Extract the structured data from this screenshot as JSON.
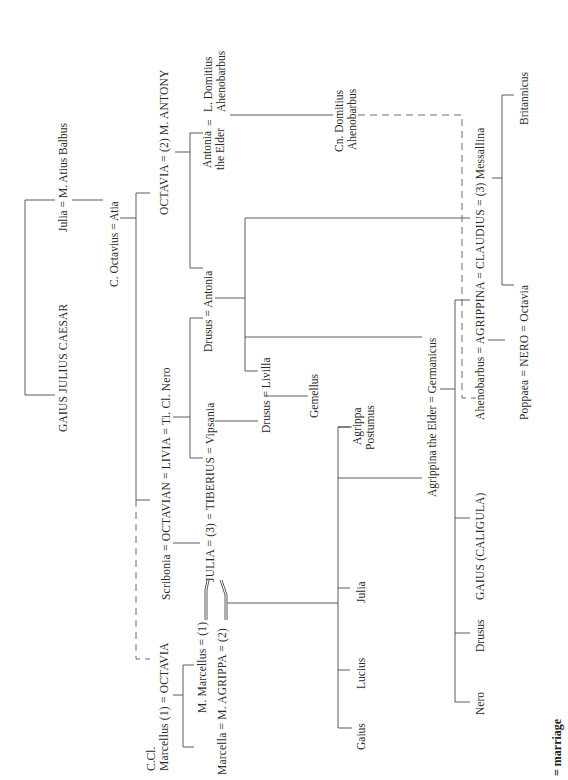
{
  "diagram": {
    "orientation": "rotated 90 degrees counter-clockwise",
    "legend": {
      "symbol": "=",
      "label": "= marriage"
    },
    "people": {
      "caesar": "GAIUS JULIUS CAESAR",
      "julia_balbus": "Julia = M. Atius Balbus",
      "octavius_atia": "C. Octavius = Atia",
      "octavia_antony": "OCTAVIA = (2) M. ANTONY",
      "antonia_elder_1": "Antonia",
      "antonia_elder_2": "the Elder",
      "eq1": "=",
      "l_domitius_1": "L. Domitius",
      "l_domitius_2": "Ahenobarbus",
      "cn_domitius_1": "Cn. Domitius",
      "cn_domitius_2": "Ahenobarbus",
      "claudius_row": "Ahenobarbus = AGRIPPINA = CLAUDIUS = (3) Messallina",
      "britannicus": "Britannicus",
      "nero_row": "Poppaea = NERO = Octavia",
      "octavian_row": "Scribonia = OCTAVIAN = LIVIA = Ti. Cl. Nero",
      "drusus_antonia": "Drusus = Antonia",
      "tiberius_row": "JULIA = (3) = TIBERIUS = Vipsania",
      "drusus_livilla": "Drusus = Livilla",
      "gemellus": "Gemellus",
      "agrippina_germanicus": "Agrippina the Elder = Germanicus",
      "agrippa_postumus_1": "Agrippa",
      "agrippa_postumus_2": "Postumus",
      "julia_child": "Julia",
      "lucius": "Lucius",
      "gaius": "Gaius",
      "caligula": "GAIUS (CALIGULA)",
      "drusus_child": "Drusus",
      "nero_child": "Nero",
      "ccl": "C.Cl.",
      "marcellus_octavia": "Marcellus (1) = OCTAVIA",
      "m_marcellus": "M. Marcellus = (1)",
      "marcella_agrippa": "Marcella = M. AGRIPPA = (2)"
    },
    "relations": [
      {
        "type": "marriage",
        "a": "Julia",
        "b": "M. Atius Balbus"
      },
      {
        "type": "marriage",
        "a": "C. Octavius",
        "b": "Atia"
      },
      {
        "type": "marriage",
        "a": "OCTAVIA",
        "b": "M. ANTONY",
        "order": 2
      },
      {
        "type": "marriage",
        "a": "Antonia the Elder",
        "b": "L. Domitius Ahenobarbus"
      },
      {
        "type": "marriage",
        "a": "Scribonia",
        "b": "OCTAVIAN"
      },
      {
        "type": "marriage",
        "a": "OCTAVIAN",
        "b": "LIVIA"
      },
      {
        "type": "marriage",
        "a": "LIVIA",
        "b": "Ti. Cl. Nero"
      },
      {
        "type": "marriage",
        "a": "Drusus",
        "b": "Antonia"
      },
      {
        "type": "marriage",
        "a": "JULIA",
        "b": "TIBERIUS",
        "order": 3
      },
      {
        "type": "marriage",
        "a": "TIBERIUS",
        "b": "Vipsania"
      },
      {
        "type": "marriage",
        "a": "Drusus",
        "b": "Livilla"
      },
      {
        "type": "marriage",
        "a": "Agrippina the Elder",
        "b": "Germanicus"
      },
      {
        "type": "marriage",
        "a": "Ahenobarbus",
        "b": "AGRIPPINA"
      },
      {
        "type": "marriage",
        "a": "AGRIPPINA",
        "b": "CLAUDIUS"
      },
      {
        "type": "marriage",
        "a": "CLAUDIUS",
        "b": "Messallina",
        "order": 3
      },
      {
        "type": "marriage",
        "a": "Poppaea",
        "b": "NERO"
      },
      {
        "type": "marriage",
        "a": "NERO",
        "b": "Octavia"
      },
      {
        "type": "marriage",
        "a": "C.Cl. Marcellus",
        "b": "OCTAVIA",
        "order": 1
      },
      {
        "type": "marriage",
        "a": "M. Marcellus",
        "b": "JULIA",
        "order": 1
      },
      {
        "type": "marriage",
        "a": "Marcella",
        "b": "M. AGRIPPA"
      },
      {
        "type": "marriage",
        "a": "M. AGRIPPA",
        "b": "JULIA",
        "order": 2
      }
    ]
  }
}
